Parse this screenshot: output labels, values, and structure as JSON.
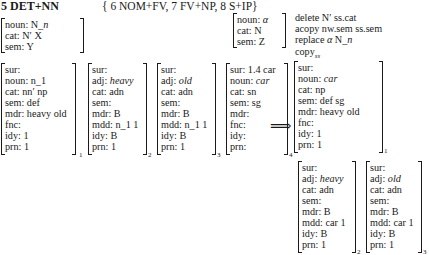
{
  "rule": {
    "name": "5 DET+NN",
    "rule_package": "{ 6 NOM+FV, 7 FV+NP, 8 S+IP}"
  },
  "patterns": {
    "ss": [
      "noun: N_n",
      "cat: N′ X",
      "sem: Y"
    ],
    "nw": [
      "noun: α",
      "cat: N",
      "sem: Z"
    ]
  },
  "operations": [
    "delete N′ ss.cat",
    "acopy nw.sem ss.sem",
    "replace α N_n",
    "copy_ss"
  ],
  "input": [
    {
      "index": "1",
      "rows": [
        "sur:",
        "noun: n_1",
        "cat: nn′ np",
        "sem: def",
        "mdr: heavy old",
        "fnc:",
        "idy: 1",
        "prn: 1"
      ]
    },
    {
      "index": "2",
      "rows": [
        "sur:",
        "adj: heavy",
        "cat: adn",
        "sem:",
        "mdr: B",
        "mdd: n_1 1",
        "idy: B",
        "prn: 1"
      ]
    },
    {
      "index": "3",
      "rows": [
        "sur:",
        "adj: old",
        "cat: adn",
        "sem:",
        "mdr: B",
        "mdd: n_1 1",
        "idy: B",
        "prn: 1"
      ]
    },
    {
      "index": "4",
      "rows": [
        "sur: 1.4 car",
        "noun: car",
        "cat: sn",
        "sem: sg",
        "mdr:",
        "fnc:",
        "idy:",
        "prn:"
      ]
    }
  ],
  "arrow": "⟹",
  "output": [
    {
      "index": "1",
      "rows": [
        "sur:",
        "noun: car",
        "cat: np",
        "sem: def sg",
        "mdr: heavy old",
        "fnc:",
        "idy: 1",
        "prn: 1"
      ]
    },
    {
      "index": "2",
      "rows": [
        "sur:",
        "adj: heavy",
        "cat: adn",
        "sem:",
        "mdr: B",
        "mdd: car 1",
        "idy: B",
        "prn: 1"
      ]
    },
    {
      "index": "3",
      "rows": [
        "sur:",
        "adj: old",
        "cat: adn",
        "sem:",
        "mdr: B",
        "mdd: car 1",
        "idy: B",
        "prn: 1"
      ]
    }
  ]
}
